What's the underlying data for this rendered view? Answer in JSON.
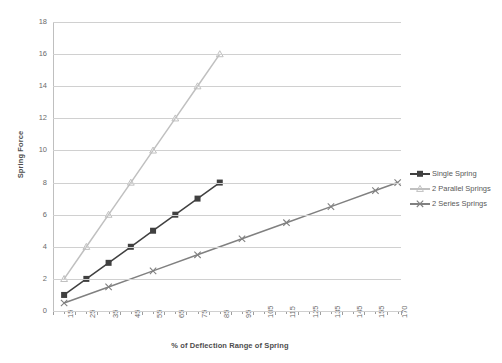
{
  "chart_data": {
    "type": "line",
    "title": "",
    "xlabel": "% of Deflection Range of Spring",
    "ylabel": "Spring Force",
    "grid": true,
    "legend_position": "right",
    "ylim": [
      0,
      18
    ],
    "yticks": [
      0,
      2,
      4,
      6,
      8,
      10,
      12,
      14,
      16,
      18
    ],
    "xtick_labels": [
      "15",
      "25",
      "35",
      "45",
      "55",
      "65",
      "75",
      "85",
      "95",
      "105",
      "115",
      "125",
      "135",
      "145",
      "155",
      "170"
    ],
    "x": [
      15,
      25,
      35,
      45,
      55,
      65,
      75,
      85,
      95,
      105,
      115,
      125,
      135,
      145,
      155,
      170
    ],
    "series": [
      {
        "name": "Single Spring",
        "color": "#404040",
        "marker": "square",
        "x": [
          15,
          25,
          35,
          45,
          55,
          65,
          75,
          85
        ],
        "values": [
          1,
          2,
          3,
          4,
          5,
          6,
          7,
          8
        ]
      },
      {
        "name": "2 Parallel Springs",
        "color": "#c0c0c0",
        "marker": "triangle",
        "x": [
          15,
          25,
          35,
          45,
          55,
          65,
          75,
          85
        ],
        "values": [
          2,
          4,
          6,
          8,
          10,
          12,
          14,
          16
        ]
      },
      {
        "name": "2 Series Springs",
        "color": "#808080",
        "marker": "cross",
        "x": [
          15,
          35,
          55,
          75,
          95,
          115,
          135,
          155,
          170
        ],
        "values": [
          0.5,
          1.5,
          2.5,
          3.5,
          4.5,
          5.5,
          6.5,
          7.5,
          8
        ]
      }
    ]
  },
  "legend": {
    "items": [
      {
        "label": "Single Spring"
      },
      {
        "label": "2 Parallel Springs"
      },
      {
        "label": "2 Series Springs"
      }
    ]
  },
  "axes": {
    "y_title": "Spring Force",
    "x_title": "% of Deflection Range of Spring"
  }
}
